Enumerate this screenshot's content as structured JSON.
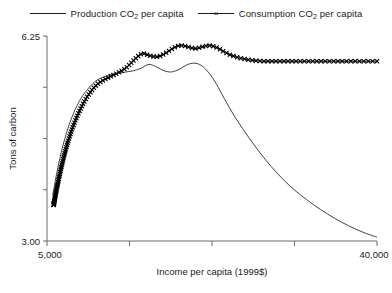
{
  "chart_data": {
    "type": "line",
    "title": "",
    "xlabel": "Income per capita (1999$)",
    "ylabel": "Tons of carbon",
    "xlim": [
      5000,
      40000
    ],
    "ylim": [
      3.0,
      6.25
    ],
    "xtick_labels": [
      "5,000",
      "40,000"
    ],
    "ytick_labels": [
      "6.25",
      "3.00"
    ],
    "x_tick_count": 5,
    "y_tick_count": 5,
    "grid": false,
    "legend_position": "top-center",
    "series": [
      {
        "name": "Production CO2 per capita",
        "legend_label": "Production CO",
        "legend_sub": "2",
        "legend_tail": " per capita",
        "marker": "none",
        "x": [
          5600,
          6000,
          6500,
          7100,
          7800,
          8600,
          9400,
          10200,
          11000,
          11800,
          12600,
          13400,
          14200,
          15000,
          15800,
          16600,
          17400,
          18200,
          19000,
          19800,
          20600,
          21400,
          22200,
          23000,
          23800,
          25000,
          26500,
          28000,
          29500,
          31000,
          32500,
          34000,
          35500,
          37000,
          38500,
          40000
        ],
        "y": [
          3.72,
          4.05,
          4.4,
          4.73,
          5.02,
          5.26,
          5.42,
          5.54,
          5.6,
          5.64,
          5.66,
          5.68,
          5.7,
          5.74,
          5.8,
          5.76,
          5.7,
          5.68,
          5.72,
          5.79,
          5.82,
          5.78,
          5.66,
          5.48,
          5.26,
          4.95,
          4.62,
          4.32,
          4.06,
          3.84,
          3.66,
          3.5,
          3.36,
          3.24,
          3.14,
          3.06
        ]
      },
      {
        "name": "Consumption CO2 per capita",
        "legend_label": "Consumption CO",
        "legend_sub": "2",
        "legend_tail": " per capita",
        "marker": "x",
        "x": [
          5700,
          6100,
          6600,
          7200,
          7900,
          8700,
          9500,
          10300,
          11100,
          11900,
          12700,
          13500,
          14300,
          15100,
          15900,
          16700,
          17500,
          18300,
          19100,
          19900,
          20700,
          21500,
          22300,
          23100,
          23900,
          25000,
          26500,
          28000,
          29500,
          31000,
          32500,
          34000,
          35500,
          37000,
          38500,
          40000
        ],
        "y": [
          3.57,
          3.88,
          4.22,
          4.56,
          4.87,
          5.14,
          5.34,
          5.48,
          5.56,
          5.62,
          5.68,
          5.76,
          5.88,
          5.97,
          5.94,
          5.92,
          5.97,
          6.05,
          6.1,
          6.08,
          6.05,
          6.08,
          6.1,
          6.06,
          5.99,
          5.92,
          5.87,
          5.85,
          5.85,
          5.85,
          5.85,
          5.85,
          5.85,
          5.85,
          5.85,
          5.85
        ]
      }
    ]
  }
}
